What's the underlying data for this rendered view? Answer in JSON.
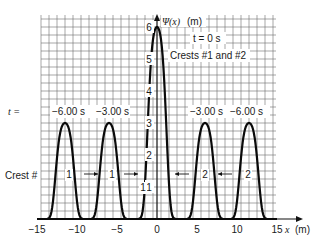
{
  "chart_data": {
    "type": "line",
    "title": "",
    "xlabel": "x (m)",
    "ylabel": "Ψ(x) (m)",
    "xlim": [
      -15,
      15
    ],
    "ylim": [
      0,
      6.3
    ],
    "grid": true,
    "x_ticks": [
      -15,
      -10,
      -5,
      0,
      5,
      10,
      15
    ],
    "x_tick_labels": [
      "−15",
      "−10",
      "−5",
      "0",
      "5",
      "10",
      "15"
    ],
    "y_ticks": [
      1,
      2,
      3,
      4,
      5,
      6
    ],
    "y_tick_labels": [
      "1",
      "2",
      "3",
      "4",
      "5",
      "6"
    ],
    "series": [
      {
        "name": "t = −6.00 s (crest 1)",
        "peak_x": -11.5,
        "peak_y": 3,
        "width": 1.2
      },
      {
        "name": "t = −3.00 s (crest 1)",
        "peak_x": -6,
        "peak_y": 3,
        "width": 1.2
      },
      {
        "name": "t = 0 s (crests #1 and #2)",
        "peak_x": 0,
        "peak_y": 6,
        "width": 1.2
      },
      {
        "name": "t = −3.00 s (crest 2)",
        "peak_x": 6,
        "peak_y": 3,
        "width": 1.2
      },
      {
        "name": "t = −6.00 s (crest 2)",
        "peak_x": 11.5,
        "peak_y": 3,
        "width": 1.2
      }
    ],
    "annotations": {
      "t_prefix": "t =",
      "time_labels_left": [
        "−6.00  s",
        "−3.00  s"
      ],
      "time_labels_right": [
        "−3.00  s",
        "−6.00  s"
      ],
      "t_zero": "t = 0  s",
      "crests_label": "Crests #1 and #2",
      "crest_row_label": "Crest #",
      "crest_numbers": [
        "1",
        "1",
        "1",
        "2",
        "2"
      ],
      "arrows": [
        "right",
        "right",
        "left",
        "left"
      ]
    }
  }
}
